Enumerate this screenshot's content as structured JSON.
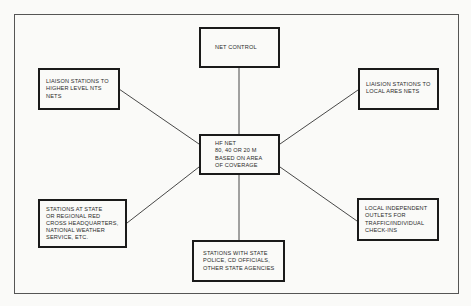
{
  "diagram": {
    "type": "hub-and-spoke network diagram",
    "colors": {
      "background": "#fafaf8",
      "border": "#1a1a1a",
      "text": "#2a2a2a",
      "connector": "#333333"
    },
    "nodes": {
      "net_control": {
        "lines": [
          "NET CONTROL"
        ]
      },
      "hf_net": {
        "lines": [
          "HF NET",
          "80, 40 OR 20 M",
          "BASED ON AREA",
          "OF COVERAGE"
        ]
      },
      "liaison_higher": {
        "lines": [
          "LIAISON STATIONS TO",
          "HIGHER LEVEL NTS",
          "NETS"
        ]
      },
      "liaison_local": {
        "lines": [
          "LIAISION STATIONS TO",
          "LOCAL ARES NETS"
        ]
      },
      "red_cross": {
        "lines": [
          "STATIONS AT STATE",
          "OR REGIONAL RED",
          "CROSS HEADQUARTERS,",
          "NATIONAL WEATHER",
          "SERVICE, ETC."
        ]
      },
      "local_outlets": {
        "lines": [
          "LOCAL INDEPENDENT",
          "OUTLETS FOR",
          "TRAFFIC/INDIVIDUAL",
          "CHECK-INS"
        ]
      },
      "state_police": {
        "lines": [
          "STATIONS WITH STATE",
          "POLICE, CD OFFICIALS,",
          "OTHER STATE AGENCIES"
        ]
      }
    },
    "edges": [
      {
        "from": "hf_net",
        "to": "net_control"
      },
      {
        "from": "hf_net",
        "to": "liaison_higher"
      },
      {
        "from": "hf_net",
        "to": "liaison_local"
      },
      {
        "from": "hf_net",
        "to": "red_cross"
      },
      {
        "from": "hf_net",
        "to": "local_outlets"
      },
      {
        "from": "hf_net",
        "to": "state_police"
      }
    ]
  }
}
